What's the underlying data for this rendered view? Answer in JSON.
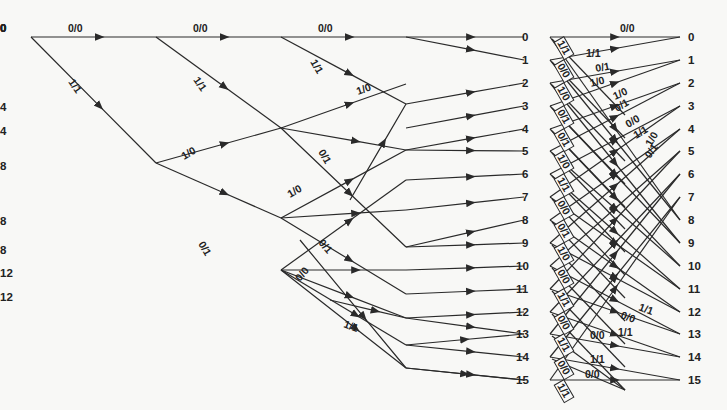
{
  "diagram": {
    "type": "trellis",
    "title": "",
    "edge_color": "#2a2a2a",
    "text_color": "#222222",
    "background": "#f8f8f6",
    "num_states": 16,
    "row_y": [
      37,
      60,
      83,
      106,
      129,
      151,
      174,
      197,
      220,
      243,
      266,
      289,
      312,
      334,
      357,
      380
    ],
    "stages_x": [
      31,
      156,
      281,
      406,
      530
    ],
    "final_x": 688,
    "stage_nodes": [
      {
        "x": 31,
        "states": [
          {
            "s": 0,
            "y": 37
          }
        ]
      },
      {
        "x": 156,
        "states": [
          {
            "s": 0,
            "y": 37
          },
          {
            "s": 8,
            "y": 163
          }
        ]
      },
      {
        "x": 281,
        "states": [
          {
            "s": 0,
            "y": 37
          },
          {
            "s": 4,
            "y": 128
          },
          {
            "s": 8,
            "y": 218
          },
          {
            "s": 12,
            "y": 270
          }
        ]
      },
      {
        "x": 406,
        "states": [
          {
            "s": 0,
            "y": 37
          },
          {
            "s": 4,
            "y": 104
          },
          {
            "s": 8,
            "y": 247
          },
          {
            "s": 12,
            "y": 294
          }
        ]
      }
    ],
    "top_edges": [
      {
        "x1": 31,
        "y1": 37,
        "x2": 156,
        "y2": 37,
        "label": "0/0",
        "lx": 68,
        "ly": 32,
        "rot": 0
      },
      {
        "x1": 31,
        "y1": 37,
        "x2": 156,
        "y2": 163,
        "label": "1/1",
        "lx": 68,
        "ly": 82,
        "rot": 55
      },
      {
        "x1": 156,
        "y1": 37,
        "x2": 281,
        "y2": 37,
        "label": "0/0",
        "lx": 193,
        "ly": 32,
        "rot": 0
      },
      {
        "x1": 156,
        "y1": 37,
        "x2": 281,
        "y2": 128,
        "label": "1/1",
        "lx": 193,
        "ly": 80,
        "rot": 55
      },
      {
        "x1": 156,
        "y1": 163,
        "x2": 281,
        "y2": 128,
        "label": "1/0",
        "lx": 184,
        "ly": 160,
        "rot": -30
      },
      {
        "x1": 156,
        "y1": 163,
        "x2": 281,
        "y2": 218,
        "label": "0/1",
        "lx": 198,
        "ly": 244,
        "rot": 60
      },
      {
        "x1": 281,
        "y1": 37,
        "x2": 406,
        "y2": 37,
        "label": "0/0",
        "lx": 318,
        "ly": 32,
        "rot": 0
      },
      {
        "x1": 281,
        "y1": 37,
        "x2": 406,
        "y2": 104,
        "label": "1/1",
        "lx": 310,
        "ly": 62,
        "rot": 60
      },
      {
        "x1": 281,
        "y1": 128,
        "x2": 406,
        "y2": 84,
        "label": "1/0",
        "lx": 358,
        "ly": 95,
        "rot": -20
      },
      {
        "x1": 281,
        "y1": 128,
        "x2": 406,
        "y2": 247,
        "label": "0/1",
        "lx": 318,
        "ly": 152,
        "rot": 60
      },
      {
        "x1": 281,
        "y1": 218,
        "x2": 406,
        "y2": 150,
        "label": "1/0",
        "lx": 290,
        "ly": 198,
        "rot": -30
      },
      {
        "x1": 281,
        "y1": 218,
        "x2": 406,
        "y2": 294,
        "label": "0/1",
        "lx": 318,
        "ly": 243,
        "rot": 50
      },
      {
        "x1": 281,
        "y1": 270,
        "x2": 406,
        "y2": 180,
        "label": "0/0",
        "lx": 300,
        "ly": 282,
        "rot": -50
      },
      {
        "x1": 281,
        "y1": 270,
        "x2": 406,
        "y2": 318,
        "label": "1/1",
        "lx": 343,
        "ly": 327,
        "rot": 20
      }
    ],
    "inner_nodes": [
      {
        "x": 406,
        "y": 37
      },
      {
        "x": 406,
        "y": 104
      },
      {
        "x": 406,
        "y": 128
      },
      {
        "x": 406,
        "y": 150
      },
      {
        "x": 406,
        "y": 180
      },
      {
        "x": 406,
        "y": 210
      },
      {
        "x": 406,
        "y": 247
      },
      {
        "x": 406,
        "y": 270
      },
      {
        "x": 406,
        "y": 294
      },
      {
        "x": 406,
        "y": 318
      },
      {
        "x": 406,
        "y": 345
      },
      {
        "x": 406,
        "y": 368
      }
    ],
    "stage4_labels": [
      "0",
      "1",
      "2",
      "3",
      "4",
      "5",
      "6",
      "7",
      "8",
      "9",
      "10",
      "11",
      "12",
      "13",
      "14",
      "15"
    ],
    "final_labels": [
      "0",
      "1",
      "2",
      "3",
      "4",
      "5",
      "6",
      "7",
      "8",
      "9",
      "10",
      "11",
      "12",
      "13",
      "14",
      "15"
    ],
    "box_labels": [
      "1/1",
      "0/0",
      "1/0",
      "0/1",
      "0/1",
      "1/0",
      "1/1",
      "0/0",
      "0/1",
      "1/0",
      "0/0",
      "1/1",
      "0/0",
      "1/1",
      "0/0",
      "1/1"
    ],
    "right_labels": [
      {
        "text": "0/0",
        "x": 620,
        "y": 32,
        "rot": 0
      },
      {
        "text": "1/1",
        "x": 586,
        "y": 57,
        "rot": 0
      },
      {
        "text": "0/1",
        "x": 596,
        "y": 72,
        "rot": -10
      },
      {
        "text": "1/0",
        "x": 591,
        "y": 87,
        "rot": -15
      },
      {
        "text": "1/0",
        "x": 615,
        "y": 100,
        "rot": -25
      },
      {
        "text": "0/1",
        "x": 617,
        "y": 112,
        "rot": -30
      },
      {
        "text": "0/0",
        "x": 628,
        "y": 128,
        "rot": -30
      },
      {
        "text": "1/1",
        "x": 636,
        "y": 139,
        "rot": -30
      },
      {
        "text": "1/0",
        "x": 651,
        "y": 147,
        "rot": -60
      },
      {
        "text": "0/1",
        "x": 650,
        "y": 159,
        "rot": -55
      },
      {
        "text": "1/1",
        "x": 638,
        "y": 310,
        "rot": 20
      },
      {
        "text": "0/0",
        "x": 620,
        "y": 318,
        "rot": 20
      },
      {
        "text": "1/1",
        "x": 618,
        "y": 336,
        "rot": 0
      },
      {
        "text": "0/0",
        "x": 590,
        "y": 339,
        "rot": 0
      },
      {
        "text": "1/1",
        "x": 590,
        "y": 363,
        "rot": 0
      },
      {
        "text": "0/0",
        "x": 585,
        "y": 378,
        "rot": 0
      }
    ]
  }
}
